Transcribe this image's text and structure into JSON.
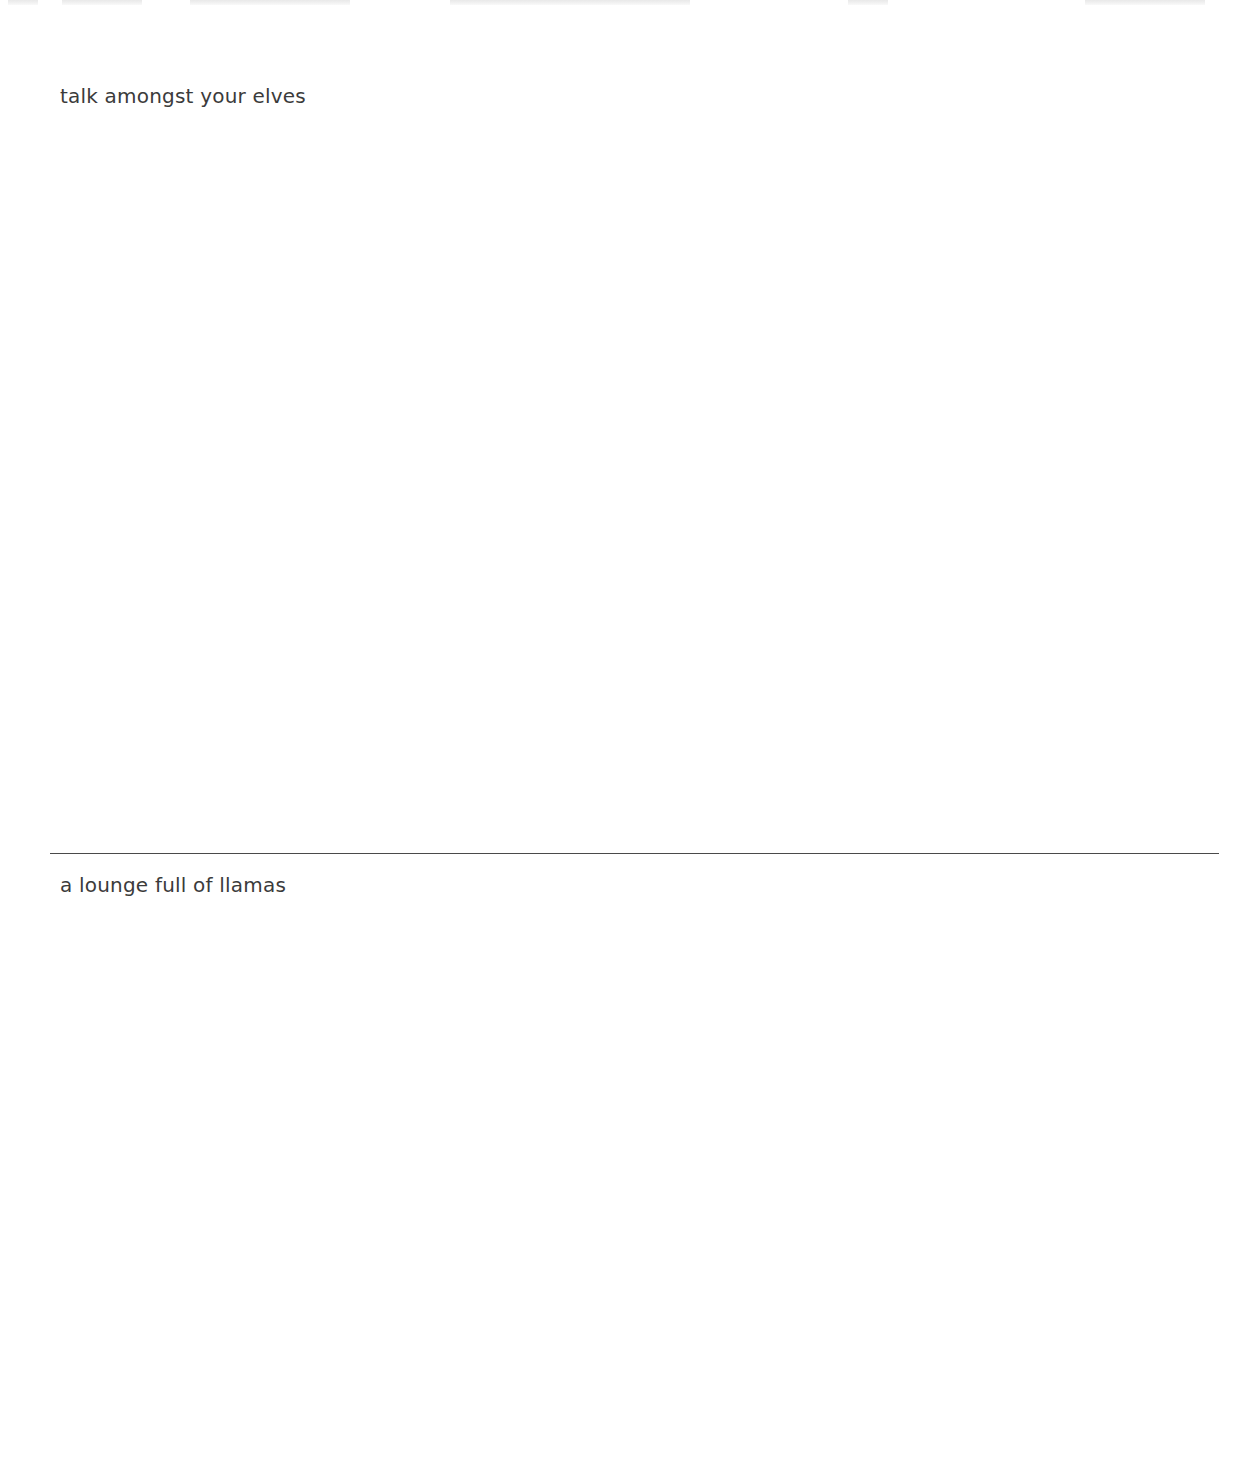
{
  "page": {
    "background": "#ffffff",
    "text_color": "#3b3b3b",
    "divider_color": "#4a4a4a"
  },
  "sections": [
    {
      "caption": "talk amongst your elves"
    },
    {
      "caption": "a lounge full of llamas"
    }
  ]
}
